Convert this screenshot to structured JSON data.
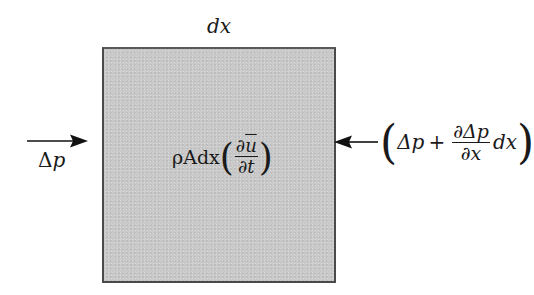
{
  "diagram": {
    "type": "free-body control volume",
    "element": {
      "fill_color": "#c9c9c9",
      "border_color": "#4a4a4a",
      "width_label": "dx",
      "inertia_term": {
        "prefix": "ρAdx",
        "numerator": "∂ū",
        "numerator_symbol": "∂",
        "numerator_var": "u",
        "denominator": "∂t",
        "text": "ρAdx(∂ū/∂t)"
      }
    },
    "left_force": {
      "direction": "right",
      "label": "Δp",
      "delta": "Δ",
      "var": "p"
    },
    "right_force": {
      "direction": "left",
      "text": "(Δp + ∂Δp/∂x dx)",
      "term1": "Δp",
      "plus": "+",
      "frac_num": "∂Δp",
      "frac_den": "∂x",
      "suffix": "dx",
      "open_paren": "(",
      "close_paren": ")"
    },
    "arrow_color": "#111111"
  }
}
